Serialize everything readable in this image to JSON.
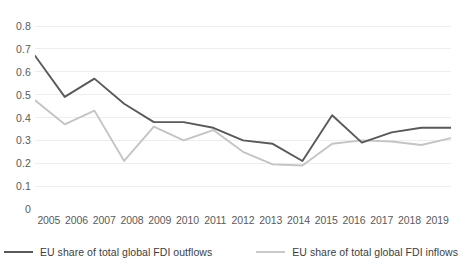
{
  "chart_data": {
    "type": "line",
    "title": "",
    "xlabel": "",
    "ylabel": "",
    "x": [
      2005,
      2006,
      2007,
      2008,
      2009,
      2010,
      2011,
      2012,
      2013,
      2014,
      2015,
      2016,
      2017,
      2018,
      2019
    ],
    "categories": [
      "2005",
      "2006",
      "2007",
      "2008",
      "2009",
      "2010",
      "2011",
      "2012",
      "2013",
      "2014",
      "2015",
      "2016",
      "2017",
      "2018",
      "2019"
    ],
    "ylim": [
      0,
      0.8
    ],
    "xlim": [
      2005,
      2019
    ],
    "yticks": [
      0,
      0.1,
      0.2,
      0.3,
      0.4,
      0.5,
      0.6,
      0.7,
      0.8
    ],
    "ytick_labels": [
      "0",
      "0.1",
      "0.2",
      "0.3",
      "0.4",
      "0.5",
      "0.6",
      "0.7",
      "0.8"
    ],
    "grid": true,
    "grid_axis": "y",
    "legend_position": "bottom",
    "series": [
      {
        "name": "EU share of total global FDI outflows",
        "color": "#595959",
        "width": 1.9,
        "values": [
          0.67,
          0.49,
          0.57,
          0.46,
          0.38,
          0.38,
          0.355,
          0.3,
          0.285,
          0.21,
          0.41,
          0.29,
          0.335,
          0.355,
          0.355
        ]
      },
      {
        "name": "EU share of total global FDI inflows",
        "color": "#c4c4c4",
        "width": 1.9,
        "values": [
          0.475,
          0.37,
          0.43,
          0.21,
          0.36,
          0.3,
          0.345,
          0.25,
          0.195,
          0.19,
          0.285,
          0.3,
          0.295,
          0.28,
          0.31
        ]
      }
    ]
  },
  "legend": {
    "entries": [
      {
        "label": "EU share of total global FDI outflows",
        "color": "#595959"
      },
      {
        "label": "EU share of total global FDI inflows",
        "color": "#c9c9c9"
      }
    ]
  },
  "colors": {
    "background": "#ffffff",
    "gridline": "#eeeeee",
    "tick_text": "#5a5a5a",
    "legend_text": "#3d3d3d",
    "series_outflows": "#595959",
    "series_inflows": "#c4c4c4"
  }
}
